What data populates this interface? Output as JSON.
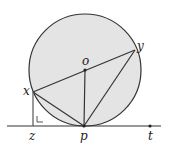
{
  "diagram": {
    "labels": {
      "o": "o",
      "x": "x",
      "y": "y",
      "z": "z",
      "p": "p",
      "t": "t"
    },
    "colors": {
      "circle_fill": "#e4e4e4",
      "stroke": "#333333",
      "background": "#ffffff"
    },
    "points": {
      "o": [
        85,
        70
      ],
      "x": [
        33,
        92
      ],
      "y": [
        135,
        50
      ],
      "z": [
        33,
        126
      ],
      "p": [
        84,
        126
      ],
      "t": [
        150,
        126
      ]
    }
  }
}
